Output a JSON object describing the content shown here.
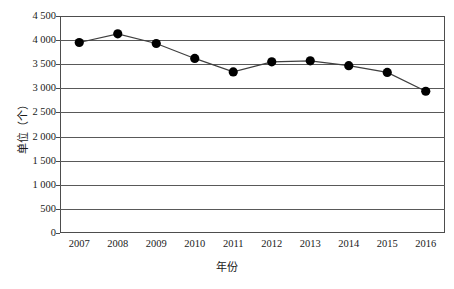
{
  "chart_data": {
    "type": "line",
    "title": "",
    "subtitle": "",
    "xlabel": "年份",
    "ylabel": "单位（个）",
    "categories": [
      "2007",
      "2008",
      "2009",
      "2010",
      "2011",
      "2012",
      "2013",
      "2014",
      "2015",
      "2016"
    ],
    "values": [
      3950,
      4130,
      3930,
      3620,
      3340,
      3550,
      3570,
      3470,
      3330,
      2940
    ],
    "series": [
      {
        "name": "数量",
        "values": [
          3950,
          4130,
          3930,
          3620,
          3340,
          3550,
          3570,
          3470,
          3330,
          2940
        ]
      }
    ],
    "ylim": [
      0,
      4500
    ],
    "ytick_step": 500,
    "ytick_labels": [
      "4 500",
      "4 000",
      "3 500",
      "3 000",
      "2 500",
      "2 000",
      "1 500",
      "1 000",
      "500",
      "0"
    ],
    "ytick_values": [
      4500,
      4000,
      3500,
      3000,
      2500,
      2000,
      1500,
      1000,
      500,
      0
    ],
    "grid": true,
    "grid_axis": "y",
    "legend": false,
    "legend_position": "none",
    "marker": "filled-circle",
    "marker_color": "#000000",
    "line_color": "#3f3f3f",
    "grid_color": "#595959",
    "background_color": "#ffffff",
    "annotations": []
  }
}
